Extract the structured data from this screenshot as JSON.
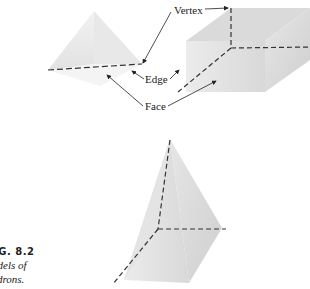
{
  "figure": {
    "labels": {
      "vertex": "Vertex",
      "edge": "Edge",
      "face": "Face"
    },
    "caption": {
      "number": "IG. 8.2",
      "line1": "odels of",
      "line2": "edrons."
    },
    "shapes": [
      "triangular-pyramid",
      "rectangular-prism",
      "square-pyramid"
    ]
  }
}
